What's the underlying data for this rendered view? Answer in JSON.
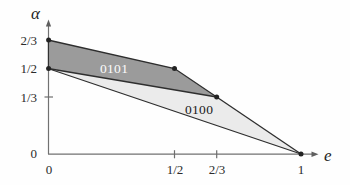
{
  "chart_data": {
    "type": "area",
    "title": "",
    "xlabel": "e",
    "ylabel": "α",
    "xlim": [
      0,
      1.12
    ],
    "ylim": [
      0,
      0.78
    ],
    "grid": false,
    "legend_position": "inline-labels",
    "xticks": [
      {
        "value": 0,
        "label": "0"
      },
      {
        "value": 0.5,
        "label": "1/2"
      },
      {
        "value": 0.6666666667,
        "label": "2/3"
      },
      {
        "value": 1,
        "label": "1"
      }
    ],
    "yticks": [
      {
        "value": 0,
        "label": "0"
      },
      {
        "value": 0.3333333333,
        "label": "1/3"
      },
      {
        "value": 0.5,
        "label": "1/2"
      },
      {
        "value": 0.6666666667,
        "label": "2/3"
      }
    ],
    "regions": [
      {
        "name": "0101",
        "label": "0101",
        "fill": "#9b9b9b",
        "label_color": "#fcfcfc",
        "vertices": [
          [
            0,
            0.6666666667
          ],
          [
            0.5,
            0.5
          ],
          [
            0.6666666667,
            0.3333333333
          ],
          [
            0,
            0.5
          ]
        ]
      },
      {
        "name": "0100",
        "label": "0100",
        "fill": "#ebebeb",
        "label_color": "#202020",
        "vertices": [
          [
            0,
            0.5
          ],
          [
            0.6666666667,
            0.3333333333
          ],
          [
            1,
            0
          ]
        ]
      }
    ],
    "marked_points": [
      {
        "x": 0,
        "y": 0.6666666667
      },
      {
        "x": 0,
        "y": 0.5
      },
      {
        "x": 0.5,
        "y": 0.5
      },
      {
        "x": 0.6666666667,
        "y": 0.3333333333
      },
      {
        "x": 1,
        "y": 0
      }
    ],
    "series": [
      {
        "name": "upper-boundary-0101",
        "points": [
          [
            0,
            0.6666666667
          ],
          [
            0.5,
            0.5
          ],
          [
            0.6666666667,
            0.3333333333
          ]
        ]
      },
      {
        "name": "shared-boundary-0101-0100",
        "points": [
          [
            0,
            0.5
          ],
          [
            0.6666666667,
            0.3333333333
          ]
        ]
      },
      {
        "name": "right-edge-0101",
        "points": [
          [
            0.6666666667,
            0.3333333333
          ],
          [
            1,
            0
          ]
        ]
      },
      {
        "name": "lower-boundary-0100",
        "points": [
          [
            0,
            0.5
          ],
          [
            1,
            0
          ]
        ]
      }
    ]
  },
  "axes": {
    "y_axis_name": "α",
    "x_axis_name": "e",
    "y_tick_labels": [
      "2/3",
      "1/2",
      "1/3",
      "0"
    ],
    "x_tick_labels": [
      "0",
      "1/2",
      "2/3",
      "1"
    ],
    "axis_color": "#6f6f6f"
  },
  "labels": {
    "region_upper": "0101",
    "region_lower": "0100"
  }
}
